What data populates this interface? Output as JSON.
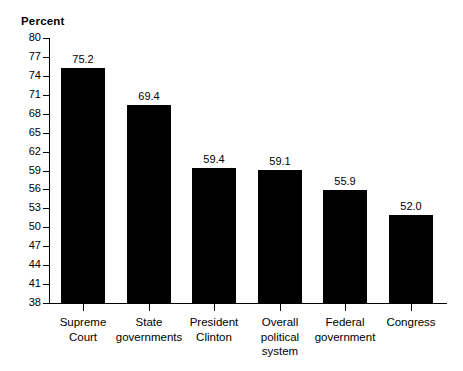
{
  "chart_data": {
    "type": "bar",
    "title": "Percent",
    "xlabel": "",
    "ylabel": "Percent",
    "ylim": [
      38,
      80
    ],
    "ytick_step": 3,
    "yticks": [
      80,
      77,
      74,
      71,
      68,
      65,
      62,
      59,
      56,
      53,
      50,
      47,
      44,
      41,
      38
    ],
    "ytick_labels": [
      "80",
      "77",
      "74",
      "71",
      "68",
      "65",
      "62",
      "59",
      "56",
      "53",
      "50",
      "47",
      "44",
      "41",
      "38"
    ],
    "grid": false,
    "legend": null,
    "bar_color": "#000000",
    "background_color": "#ffffff",
    "categories": [
      "Supreme\nCourt",
      "State\ngovernments",
      "President\nClinton",
      "Overall\npolitical\nsystem",
      "Federal\ngovernment",
      "Congress"
    ],
    "values": [
      75.2,
      69.4,
      59.4,
      59.1,
      55.9,
      52.0
    ],
    "value_labels": [
      "75.2",
      "69.4",
      "59.4",
      "59.1",
      "55.9",
      "52.0"
    ]
  }
}
